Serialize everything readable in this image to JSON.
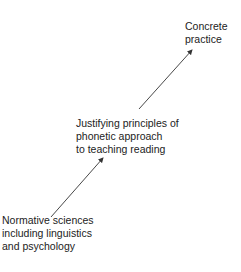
{
  "diagram": {
    "nodes": [
      {
        "id": "top",
        "lines": [
          "Concrete",
          "practice"
        ]
      },
      {
        "id": "mid",
        "lines": [
          "Justifying principles of",
          "phonetic approach",
          "to teaching reading"
        ]
      },
      {
        "id": "bottom",
        "lines": [
          "Normative sciences",
          "including linguistics",
          "and psychology"
        ]
      }
    ],
    "edges": [
      {
        "from": "bottom",
        "to": "mid",
        "type": "arrow"
      },
      {
        "from": "mid",
        "to": "top",
        "type": "arrow"
      }
    ],
    "colors": {
      "text": "#222222",
      "arrow": "#333333",
      "background": "#ffffff"
    }
  }
}
